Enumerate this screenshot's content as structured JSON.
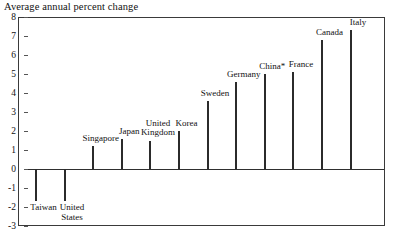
{
  "chart_data": {
    "type": "bar",
    "title": "Average annual percent change",
    "xlabel": "",
    "ylabel": "",
    "ylim": [
      -3,
      8
    ],
    "yticks": [
      8,
      7,
      6,
      5,
      4,
      3,
      2,
      1,
      0,
      -1,
      -2,
      -3
    ],
    "grid": false,
    "legend": "none",
    "zero_line": 0,
    "bar_color": "#474747",
    "categories": [
      "Taiwan",
      "United States",
      "Singapore",
      "Japan",
      "United Kingdom",
      "Korea",
      "Sweden",
      "Germany",
      "China*",
      "France",
      "Canada",
      "Italy"
    ],
    "values": [
      -1.7,
      -1.7,
      1.2,
      1.6,
      1.5,
      2.0,
      3.6,
      4.6,
      5.0,
      5.1,
      6.8,
      7.3
    ],
    "annotations": [
      "China* denotes footnote marker on China label"
    ]
  },
  "axis": {
    "tick_labels": [
      "8",
      "7",
      "6",
      "5",
      "4",
      "3",
      "2",
      "1",
      "0",
      "-1",
      "-2",
      "-3"
    ]
  },
  "bars": [
    {
      "label": "Taiwan",
      "value": -1.7,
      "label_lines": [
        "Taiwan"
      ],
      "label_pos": "below"
    },
    {
      "label": "United States",
      "value": -1.7,
      "label_lines": [
        "United",
        "States"
      ],
      "label_pos": "below"
    },
    {
      "label": "Singapore",
      "value": 1.2,
      "label_lines": [
        "Singapore"
      ],
      "label_pos": "above"
    },
    {
      "label": "Japan",
      "value": 1.6,
      "label_lines": [
        "Japan"
      ],
      "label_pos": "above"
    },
    {
      "label": "United Kingdom",
      "value": 1.5,
      "label_lines": [
        "United",
        "Kingdom"
      ],
      "label_pos": "above"
    },
    {
      "label": "Korea",
      "value": 2.0,
      "label_lines": [
        "Korea"
      ],
      "label_pos": "above"
    },
    {
      "label": "Sweden",
      "value": 3.6,
      "label_lines": [
        "Sweden"
      ],
      "label_pos": "above"
    },
    {
      "label": "Germany",
      "value": 4.6,
      "label_lines": [
        "Germany"
      ],
      "label_pos": "above"
    },
    {
      "label": "China*",
      "value": 5.0,
      "label_lines": [
        "China*"
      ],
      "label_pos": "above"
    },
    {
      "label": "France",
      "value": 5.1,
      "label_lines": [
        "France"
      ],
      "label_pos": "above"
    },
    {
      "label": "Canada",
      "value": 6.8,
      "label_lines": [
        "Canada"
      ],
      "label_pos": "above"
    },
    {
      "label": "Italy",
      "value": 7.3,
      "label_lines": [
        "Italy"
      ],
      "label_pos": "above"
    }
  ]
}
